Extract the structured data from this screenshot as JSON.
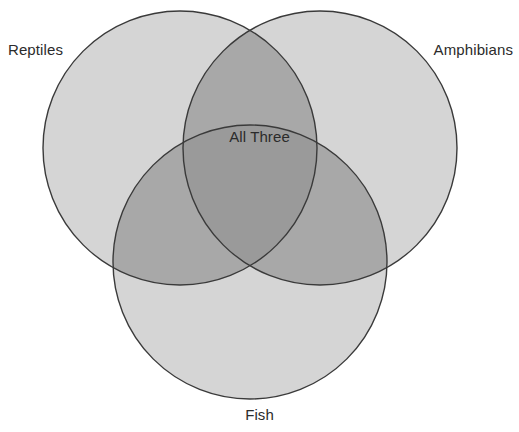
{
  "page": {
    "width": 519,
    "height": 432,
    "background": "#ffffff"
  },
  "chart_data": {
    "type": "venn",
    "title": "",
    "sets": [
      {
        "id": "reptiles",
        "label": "Reptiles",
        "cx": 180,
        "cy": 148,
        "r": 137,
        "label_position": "top-left"
      },
      {
        "id": "amphibians",
        "label": "Amphibians",
        "cx": 320,
        "cy": 148,
        "r": 137,
        "label_position": "top-right"
      },
      {
        "id": "fish",
        "label": "Fish",
        "cx": 250,
        "cy": 262,
        "r": 137,
        "label_position": "bottom-center"
      }
    ],
    "intersections": [
      {
        "id": "all-three",
        "label": "All Three",
        "members": [
          "reptiles",
          "amphibians",
          "fish"
        ],
        "label_position": "center"
      }
    ],
    "values": [],
    "legend": "none",
    "grid": false,
    "xlabel": "",
    "ylabel": ""
  },
  "diagram": {
    "labels": {
      "reptiles": "Reptiles",
      "amphibians": "Amphibians",
      "fish": "Fish",
      "all_three": "All Three"
    },
    "colors": {
      "single_fill": "#d5d5d5",
      "double_fill": "#a8a8a8",
      "triple_fill": "#9a9a9a",
      "stroke": "#3a3a3a",
      "text": "#2b2b2b",
      "background": "#ffffff"
    },
    "stroke_width": 1.4
  }
}
